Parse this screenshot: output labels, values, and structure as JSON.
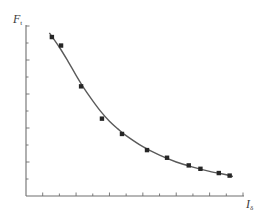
{
  "chart_data": {
    "type": "scatter",
    "title": "",
    "xlabel": "I",
    "xlabel_subscript": "δ",
    "ylabel": "F",
    "ylabel_subscript": "t",
    "grid": false,
    "legend": null,
    "xlim": [
      0,
      13
    ],
    "ylim": [
      0,
      10
    ],
    "x_ticks": [
      1,
      2,
      3,
      4,
      5,
      6,
      7,
      8,
      9,
      10,
      11,
      12,
      13
    ],
    "y_ticks": [
      1,
      2,
      3,
      4,
      5,
      6,
      7,
      8,
      9,
      10
    ],
    "tick_labels_shown": false,
    "series": [
      {
        "name": "measured",
        "marker": "square",
        "color": "#2b2b2b",
        "x": [
          1.55,
          2.1,
          3.3,
          4.55,
          5.75,
          7.25,
          8.45,
          9.75,
          10.45,
          11.55,
          12.2
        ],
        "y": [
          9.35,
          8.85,
          6.45,
          4.55,
          3.65,
          2.7,
          2.25,
          1.8,
          1.6,
          1.35,
          1.2
        ]
      },
      {
        "name": "fit",
        "type": "line",
        "color": "#555555",
        "x": [
          1.4,
          2.0,
          2.5,
          3.0,
          3.5,
          4.0,
          4.5,
          5.0,
          5.5,
          6.0,
          7.0,
          8.0,
          9.0,
          10.0,
          11.0,
          12.0,
          12.4
        ],
        "y": [
          9.6,
          8.75,
          7.95,
          7.1,
          6.3,
          5.6,
          4.95,
          4.4,
          3.95,
          3.55,
          2.9,
          2.4,
          2.0,
          1.7,
          1.45,
          1.25,
          1.15
        ]
      }
    ]
  },
  "axes": {
    "y_label": "F",
    "y_sub": "t",
    "x_label": "I",
    "x_sub": "δ"
  },
  "colors": {
    "axis": "#6e6e6e",
    "curve": "#5a5a5a",
    "marker": "#262626",
    "text": "#3a3a3a"
  }
}
